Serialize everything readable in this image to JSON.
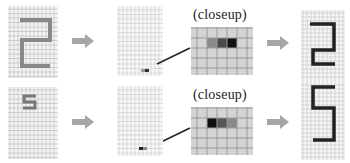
{
  "diagram": {
    "rows": [
      {
        "id": "row-digit-2",
        "input": {
          "digit": "2",
          "grid_cols": 12,
          "grid_rows": 16,
          "stroke_color": "#888888"
        },
        "pen_state": {
          "grid_cols": 12,
          "grid_rows": 16,
          "marker": "small stroke near bottom"
        },
        "closeup": {
          "label": "(closeup)",
          "cells": [
            "#c8c8c8",
            "#8a8a8a",
            "#4a4a4a",
            "#111111",
            "#c8c8c8"
          ]
        },
        "output": {
          "digit": "2",
          "stroke_color": "#222222"
        }
      },
      {
        "id": "row-digit-5",
        "input": {
          "digit": "5",
          "grid_cols": 12,
          "grid_rows": 16,
          "stroke_color": "#777777"
        },
        "pen_state": {
          "grid_cols": 12,
          "grid_rows": 16,
          "marker": "small stroke near bottom"
        },
        "closeup": {
          "label": "(closeup)",
          "cells": [
            "#c8c8c8",
            "#111111",
            "#555555",
            "#8a8a8a",
            "#c8c8c8"
          ]
        },
        "output": {
          "digit": "5",
          "stroke_color": "#222222"
        }
      }
    ],
    "colors": {
      "grid_line": "#c4c4c4",
      "grid_bg": "#f4f4f4",
      "arrow": "#a6a6a6",
      "closeup_bg": "#d4d4d4",
      "closeup_line": "#9a9a9a"
    }
  }
}
